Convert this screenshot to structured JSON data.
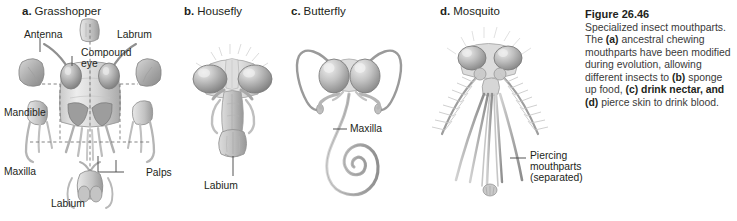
{
  "figure": {
    "number_label": "Figure 26.46",
    "caption_lead": "Specialized insect mouthparts.",
    "caption_segments": [
      {
        "text": "The ",
        "bold": false
      },
      {
        "text": "(a)",
        "bold": true
      },
      {
        "text": " ancestral chewing mouthparts have been modified during evolution, allowing different insects to ",
        "bold": false
      },
      {
        "text": "(b)",
        "bold": true
      },
      {
        "text": " sponge up food, ",
        "bold": false
      },
      {
        "text": "(c)",
        "bold": true
      },
      {
        "text": " drink nectar, and ",
        "bold": true
      },
      {
        "text": "(d)",
        "bold": true
      },
      {
        "text": " pierce skin to drink blood.",
        "bold": false
      }
    ],
    "caption_plain": "The (a) ancestral chewing mouthparts have been modified during evolution, allowing different insects to (b) sponge up food, (c) drink nectar, and (d) pierce skin to drink blood."
  },
  "panels": [
    {
      "letter": "a.",
      "name": "Grasshopper",
      "feeding_mode": "chewing",
      "labels": [
        {
          "key": "antenna",
          "text": "Antenna"
        },
        {
          "key": "labrum",
          "text": "Labrum"
        },
        {
          "key": "compound_eye",
          "text": "Compound eye"
        },
        {
          "key": "mandible",
          "text": "Mandible"
        },
        {
          "key": "maxilla",
          "text": "Maxilla"
        },
        {
          "key": "palps",
          "text": "Palps"
        },
        {
          "key": "labium",
          "text": "Labium"
        }
      ]
    },
    {
      "letter": "b.",
      "name": "Housefly",
      "feeding_mode": "sponging",
      "labels": [
        {
          "key": "labium",
          "text": "Labium"
        }
      ]
    },
    {
      "letter": "c.",
      "name": "Butterfly",
      "feeding_mode": "nectar drinking",
      "labels": [
        {
          "key": "maxilla",
          "text": "Maxilla"
        }
      ]
    },
    {
      "letter": "d.",
      "name": "Mosquito",
      "feeding_mode": "piercing",
      "labels": [
        {
          "key": "piercing_mouthparts",
          "text": "Piercing mouthparts (separated)"
        }
      ]
    }
  ],
  "colors": {
    "text": "#231f20",
    "caption_body": "#3a3a3a",
    "leader_line": "#6e6e6e",
    "art_dark": "#8d8d8d",
    "art_mid": "#b8b8b8",
    "art_light": "#dcdcdc",
    "background": "#ffffff"
  }
}
